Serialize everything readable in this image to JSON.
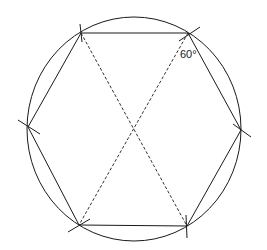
{
  "diagram": {
    "angle_label": "60°",
    "stroke_color": "#1a1a1a",
    "background": "#ffffff",
    "circle": {
      "cx": 134,
      "cy": 129,
      "rx": 107,
      "ry": 112
    },
    "vertices": [
      {
        "name": "top-left",
        "x": 81,
        "y": 33
      },
      {
        "name": "top-right",
        "x": 188,
        "y": 33
      },
      {
        "name": "right",
        "x": 241,
        "y": 130
      },
      {
        "name": "bottom-right",
        "x": 187,
        "y": 226
      },
      {
        "name": "bottom-left",
        "x": 79,
        "y": 225
      },
      {
        "name": "left",
        "x": 28,
        "y": 127
      }
    ],
    "diagonals": [
      {
        "from": "top-left",
        "to": "bottom-right",
        "style": "dashed"
      },
      {
        "from": "top-right",
        "to": "bottom-left",
        "style": "dashed"
      }
    ]
  }
}
